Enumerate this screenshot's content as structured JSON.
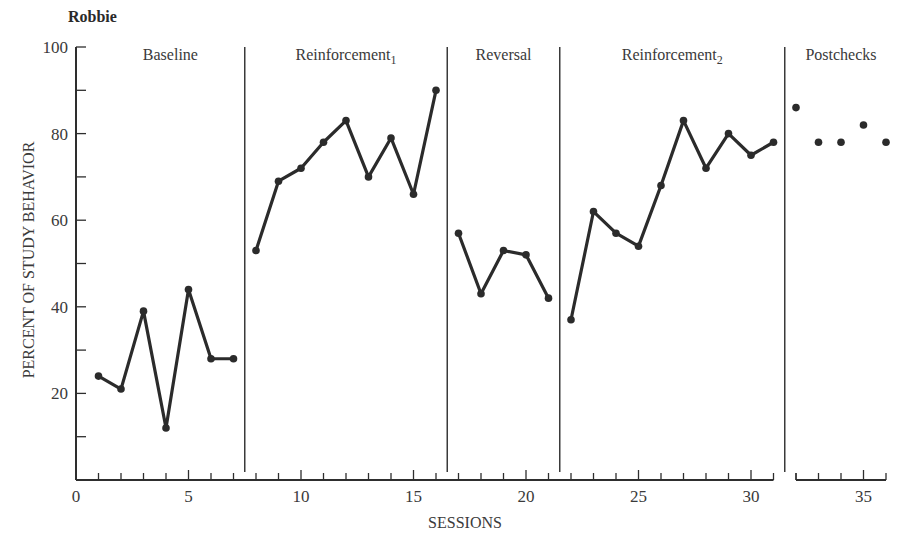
{
  "subject": "Robbie",
  "chart_data": {
    "type": "line",
    "title": "Robbie",
    "xlabel": "SESSIONS",
    "ylabel": "PERCENT OF STUDY BEHAVIOR",
    "xlim": [
      0,
      36
    ],
    "ylim": [
      0,
      100
    ],
    "x_ticks": [
      0,
      5,
      10,
      15,
      20,
      25,
      30,
      35
    ],
    "y_ticks": [
      20,
      40,
      60,
      80,
      100
    ],
    "grid": false,
    "legend": null,
    "axis_break_between_sessions": [
      31,
      32
    ],
    "phases": [
      {
        "name": "Baseline",
        "label_main": "Baseline",
        "label_sub": "",
        "sessions": [
          1,
          2,
          3,
          4,
          5,
          6,
          7
        ],
        "values": [
          24,
          21,
          39,
          12,
          44,
          28,
          28
        ],
        "connected": true
      },
      {
        "name": "Reinforcement1",
        "label_main": "Reinforcement",
        "label_sub": "1",
        "sessions": [
          8,
          9,
          10,
          11,
          12,
          13,
          14,
          15,
          16
        ],
        "values": [
          53,
          69,
          72,
          78,
          83,
          70,
          79,
          66,
          90
        ],
        "connected": true
      },
      {
        "name": "Reversal",
        "label_main": "Reversal",
        "label_sub": "",
        "sessions": [
          17,
          18,
          19,
          20,
          21
        ],
        "values": [
          57,
          43,
          53,
          52,
          42
        ],
        "connected": true
      },
      {
        "name": "Reinforcement2",
        "label_main": "Reinforcement",
        "label_sub": "2",
        "sessions": [
          22,
          23,
          24,
          25,
          26,
          27,
          28,
          29,
          30,
          31
        ],
        "values": [
          37,
          62,
          57,
          54,
          68,
          83,
          72,
          80,
          75,
          78
        ],
        "connected": true
      },
      {
        "name": "Postchecks",
        "label_main": "Postchecks",
        "label_sub": "",
        "sessions": [
          32,
          33,
          34,
          35,
          36
        ],
        "values": [
          86,
          78,
          78,
          82,
          78
        ],
        "connected": false
      }
    ],
    "phase_change_lines_after_session": [
      7.5,
      16.5,
      21.5,
      31.5
    ]
  }
}
